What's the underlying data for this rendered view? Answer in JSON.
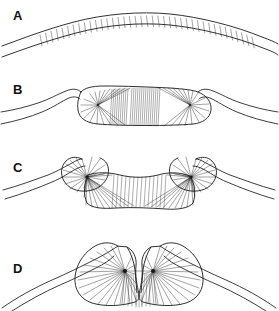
{
  "figure": {
    "background_color": "#ffffff",
    "stroke_color": "#1a1a1a",
    "width": 279,
    "height": 311,
    "panel_count": 4
  },
  "panels": [
    {
      "label": "A",
      "name": "panel-a-flat-arch",
      "description": "Gently arched two-layered band with transverse rungs between the outer and inner curves",
      "stage": 1
    },
    {
      "label": "B",
      "name": "panel-b-flattened-plate",
      "description": "Flattened horizontal plate with rounded lobes at each end; fibers fan out from a focus inside each lobe",
      "stage": 2
    },
    {
      "label": "C",
      "name": "panel-c-scrolled-ends",
      "description": "Central plate with both ends rolled into scroll-like curls; fibers converge on a dark focus in each curl",
      "stage": 3
    },
    {
      "label": "D",
      "name": "panel-d-inverted-bilobe",
      "description": "Fully inrolled bilobed heart-shaped mass with a deep central cleft and two adjacent fiber foci",
      "stage": 4
    }
  ],
  "colors": {
    "ink": "#1a1a1a",
    "fiber": "#222222",
    "focus": "#151515",
    "paper": "#ffffff"
  }
}
